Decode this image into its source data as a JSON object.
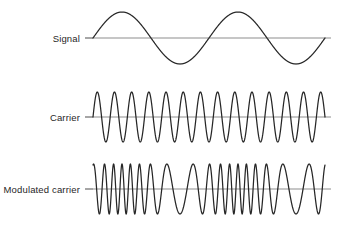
{
  "figure": {
    "background_color": "#ffffff",
    "wave_color": "#262626",
    "axis_color": "#b3b3b3",
    "leader_color": "#8c8c8c",
    "text_color": "#1f1f1f"
  },
  "rows": {
    "signal": {
      "label": "Signal"
    },
    "carrier": {
      "label": "Carrier"
    },
    "modulated": {
      "label": "Modulated carrier"
    }
  },
  "chart_data": {
    "type": "line",
    "xlabel": "",
    "ylabel": "",
    "grid": false,
    "legend_position": "left-labels",
    "x_start_px": 93,
    "x_end_px": 325,
    "axis_extend_px": 331,
    "leader_start_px": 85,
    "series": [
      {
        "name": "Signal",
        "row_label": "Signal",
        "waveform": "sine",
        "cycles": 2,
        "amplitude_px": 26,
        "baseline_y_px": 38,
        "phase_deg": 0,
        "description": "Modulating sine wave, two complete cycles, constant amplitude and constant frequency"
      },
      {
        "name": "Carrier",
        "row_label": "Carrier",
        "waveform": "sine",
        "cycles": 13.5,
        "amplitude_px": 25,
        "baseline_y_px": 117,
        "phase_deg": 0,
        "description": "Unmodulated carrier, constant high frequency and constant amplitude"
      },
      {
        "name": "Modulated carrier",
        "row_label": "Modulated carrier",
        "waveform": "fm",
        "carrier_cycles": 18,
        "modulation_index": 5.0,
        "modulating_cycles": 2,
        "amplitude_px": 25,
        "baseline_y_px": 189,
        "phase_deg": 0,
        "description": "Frequency modulated carrier: instantaneous frequency rises where the signal is positive and falls where the signal is negative; amplitude stays constant"
      }
    ]
  }
}
